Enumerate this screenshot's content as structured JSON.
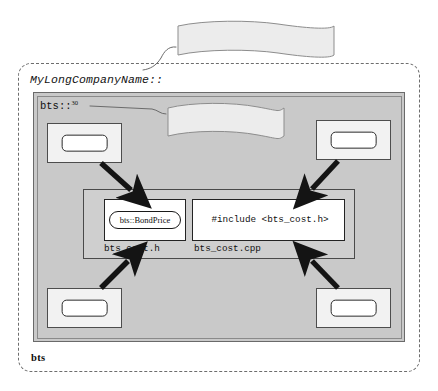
{
  "diagram": {
    "title_banner": "Enterprise-wide namespace",
    "package_banner": "Package namespace",
    "enterprise_namespace_label": "MyLongCompanyName::",
    "package_namespace_label": "bts::",
    "package_namespace_footnote": "30",
    "bottom_package_label": "bts",
    "central": {
      "class_name": "bts::BondPrice",
      "include_directive": "#include <bts_cost.h>",
      "header_file": "bts_cost.h",
      "source_file": "bts_cost.cpp"
    },
    "corner_components": [
      {
        "position": "top-left",
        "label": ""
      },
      {
        "position": "top-right",
        "label": ""
      },
      {
        "position": "bottom-left",
        "label": ""
      },
      {
        "position": "bottom-right",
        "label": ""
      }
    ],
    "colors": {
      "package_panel_fill": "#c9c9c9",
      "central_box_fill": "#cfcfcf",
      "component_fill": "#f2f2f2",
      "file_cell_fill": "#ffffff",
      "banner_fill": "#ececec",
      "outline": "#2b2b2b",
      "dashed_border": "#6d6d6d",
      "arrow": "#141414"
    }
  }
}
